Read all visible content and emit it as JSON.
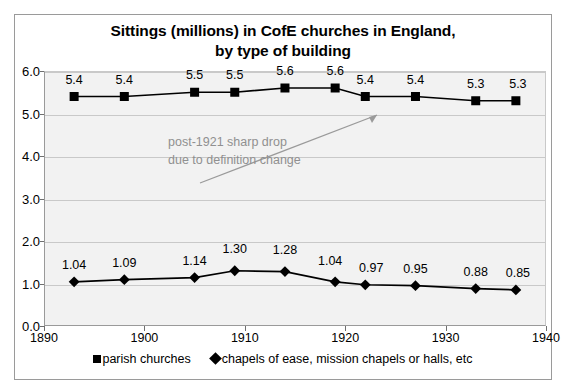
{
  "chart_data": {
    "type": "line",
    "title": "Sittings (millions) in CofE churches in England, by type of building",
    "title_line1": "Sittings (millions) in CofE churches in England,",
    "title_line2": "by type of building",
    "xlabel": "",
    "ylabel": "",
    "xlim": [
      1890,
      1940
    ],
    "ylim": [
      0.0,
      6.0
    ],
    "grid": true,
    "legend_position": "bottom",
    "x_ticks": [
      "1890",
      "1900",
      "1910",
      "1920",
      "1930",
      "1940"
    ],
    "x_tick_values": [
      1890,
      1900,
      1910,
      1920,
      1930,
      1940
    ],
    "y_ticks": [
      "0.0",
      "1.0",
      "2.0",
      "3.0",
      "4.0",
      "5.0",
      "6.0"
    ],
    "y_tick_values": [
      0.0,
      1.0,
      2.0,
      3.0,
      4.0,
      5.0,
      6.0
    ],
    "x": [
      1893,
      1898,
      1905,
      1909,
      1914,
      1919,
      1922,
      1927,
      1933,
      1937
    ],
    "series": [
      {
        "name": "parish churches",
        "marker": "square",
        "color": "#000000",
        "values": [
          5.4,
          5.4,
          5.5,
          5.5,
          5.6,
          5.6,
          5.4,
          5.4,
          5.3,
          5.3
        ],
        "labels": [
          "5.4",
          "5.4",
          "5.5",
          "5.5",
          "5.6",
          "5.6",
          "5.4",
          "5.4",
          "5.3",
          "5.3"
        ]
      },
      {
        "name": "chapels of ease, mission chapels or halls, etc",
        "marker": "diamond",
        "color": "#000000",
        "values": [
          1.04,
          1.09,
          1.14,
          1.3,
          1.28,
          1.04,
          0.97,
          0.95,
          0.88,
          0.85
        ],
        "labels": [
          "1.04",
          "1.09",
          "1.14",
          "1.30",
          "1.28",
          "1.04",
          "0.97",
          "0.95",
          "0.88",
          "0.85"
        ]
      }
    ],
    "annotations": [
      {
        "text": "post-1921 sharp drop due to definition change",
        "line1": "post-1921 sharp drop",
        "line2": "due to definition change",
        "color": "#909090",
        "points_to_year": 1922,
        "points_to_value": 5.4
      }
    ]
  },
  "legend": {
    "entries": [
      {
        "label": "parish churches",
        "marker": "square"
      },
      {
        "label": "chapels of ease, mission chapels or halls, etc",
        "marker": "diamond"
      }
    ]
  }
}
